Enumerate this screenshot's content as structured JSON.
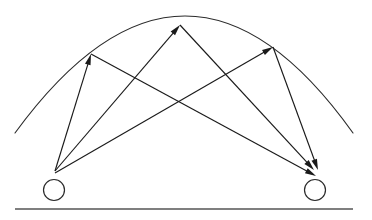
{
  "figure": {
    "background_color": "#ffffff",
    "stroke_color": "#1a1a1a",
    "ground_color": "#555555",
    "width": 372,
    "height": 220
  },
  "ground": {
    "label": "ground-line",
    "x1": 15,
    "y1": 209,
    "x2": 353,
    "y2": 209
  },
  "arc": {
    "label": "reflecting-arc",
    "left_x": 15,
    "left_y": 133,
    "apex_x": 185,
    "apex_y": 16,
    "right_x": 353,
    "right_y": 133
  },
  "nodes": [
    {
      "name": "left-node",
      "cx": 54,
      "cy": 190,
      "r": 10.5
    },
    {
      "name": "right-node",
      "cx": 315,
      "cy": 190,
      "r": 10.5
    }
  ],
  "hubs": {
    "left_hub_x": 55,
    "left_hub_y": 171,
    "right_hub_x": 316,
    "right_hub_y": 172
  },
  "reflection_points": [
    {
      "name": "left-reflection-point",
      "x": 91,
      "y": 54
    },
    {
      "name": "mid-reflection-point",
      "x": 180,
      "y": 25
    },
    {
      "name": "right-reflection-point",
      "x": 273,
      "y": 47
    }
  ],
  "rays": [
    {
      "name": "ray-left-to-left-arc",
      "from": "left-hub",
      "to": "left-reflection-point",
      "x1": 55,
      "y1": 171,
      "x2": 91,
      "y2": 54,
      "arrow_at_end": true
    },
    {
      "name": "ray-left-to-mid-arc",
      "from": "left-hub",
      "to": "mid-reflection-point",
      "x1": 55,
      "y1": 171,
      "x2": 180,
      "y2": 25,
      "arrow_at_end": true
    },
    {
      "name": "ray-left-arc-to-right-hub",
      "from": "left-reflection-point",
      "to": "right-hub",
      "x1": 91,
      "y1": 54,
      "x2": 316,
      "y2": 176,
      "arrow_at_end": true
    },
    {
      "name": "ray-mid-arc-to-right-hub",
      "from": "mid-reflection-point",
      "to": "right-hub",
      "x1": 180,
      "y1": 25,
      "x2": 314,
      "y2": 170,
      "arrow_at_end": true
    },
    {
      "name": "ray-right-arc-to-right-hub",
      "from": "right-reflection-point",
      "to": "right-hub",
      "x1": 273,
      "y1": 47,
      "x2": 318,
      "y2": 170,
      "arrow_at_end": true
    },
    {
      "name": "ray-left-hub-to-right-arc",
      "from": "left-hub",
      "to": "right-reflection-point",
      "x1": 55,
      "y1": 173,
      "x2": 273,
      "y2": 47,
      "arrow_at_end": true
    }
  ],
  "chart_data": {
    "type": "diagram",
    "node_count": 2,
    "ray_count": 6,
    "reflection_point_count": 3
  }
}
